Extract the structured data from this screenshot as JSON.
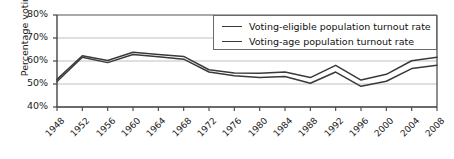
{
  "chart_data": {
    "type": "line",
    "title": "",
    "xlabel": "",
    "ylabel": "Percentage voting",
    "ylim": [
      40,
      80
    ],
    "yticks": [
      "40%",
      "50%",
      "60%",
      "70%",
      "80%"
    ],
    "ytick_values": [
      40,
      50,
      60,
      70,
      80
    ],
    "grid": true,
    "legend_position": "top-right",
    "categories": [
      "1948",
      "1952",
      "1956",
      "1960",
      "1964",
      "1968",
      "1972",
      "1976",
      "1980",
      "1984",
      "1988",
      "1992",
      "1996",
      "2000",
      "2004",
      "2008"
    ],
    "series": [
      {
        "name": "Voting-eligible population turnout rate",
        "color": "#3a3a3a",
        "values": [
          52.0,
          62.3,
          60.2,
          63.8,
          62.8,
          62.0,
          56.2,
          54.8,
          54.7,
          55.2,
          52.8,
          58.1,
          51.7,
          54.2,
          60.1,
          61.6
        ]
      },
      {
        "name": "Voting-age population turnout rate",
        "color": "#3a3a3a",
        "values": [
          51.1,
          61.6,
          59.3,
          62.8,
          61.9,
          60.8,
          55.2,
          53.6,
          52.8,
          53.3,
          50.3,
          55.2,
          49.0,
          51.2,
          56.7,
          58.2
        ]
      }
    ]
  },
  "legend": {
    "items": [
      {
        "label": "Voting-eligible population turnout rate"
      },
      {
        "label": "Voting-age population turnout rate"
      }
    ]
  }
}
